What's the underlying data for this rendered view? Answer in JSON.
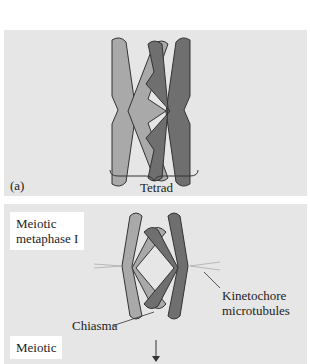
{
  "panel_a": {
    "label": "(a)",
    "brace_label": "Tetrad"
  },
  "panel_b": {
    "stage1": [
      "Meiotic",
      "metaphase I"
    ],
    "stage2": [
      "Meiotic"
    ],
    "annotations": {
      "chiasma": "Chiasma",
      "kinetochore": [
        "Kinetochore",
        "microtubules"
      ]
    }
  },
  "colors": {
    "background": "#e6e6e6",
    "light_chromatid": "#a9a9a9",
    "dark_chromatid": "#6f6f6f",
    "outline": "#333333"
  }
}
